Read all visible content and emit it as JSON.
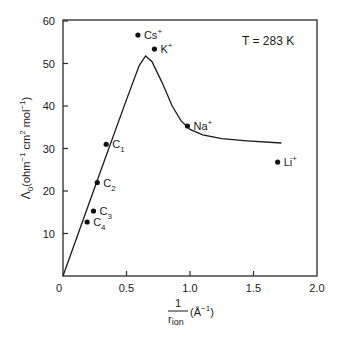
{
  "chart_data": {
    "type": "scatter",
    "title": "",
    "annotation": "T = 283 K",
    "xlabel": "1/r_ion (Å^-1)",
    "xlabel_parts": {
      "numerator": "1",
      "denominator": "r",
      "denominator_sub": "ion",
      "unit": "(Å",
      "unit_sup": "−1",
      "unit_close": ")"
    },
    "ylabel": "Λ0 (ohm^-1 cm^2 mol^-1)",
    "ylabel_parts": {
      "symbol": "Λ",
      "sub": "0",
      "unit": "(ohm",
      "sup1": "−1",
      "mid": " cm",
      "sup2": "2",
      "mid2": " mol",
      "sup3": "−1",
      "close": ")"
    },
    "xlim": [
      0,
      2.0
    ],
    "ylim": [
      0,
      60
    ],
    "xticks": [
      0,
      0.5,
      1.0,
      1.5,
      2.0
    ],
    "xtick_labels": [
      "0",
      "0.5",
      "1.0",
      "1.5",
      "2.0"
    ],
    "yticks": [
      10,
      20,
      30,
      40,
      50,
      60
    ],
    "ytick_labels": [
      "10",
      "20",
      "30",
      "40",
      "50",
      "60"
    ],
    "grid": false,
    "legend": null,
    "points": [
      {
        "label": "Cs",
        "sup": "+",
        "x": 0.59,
        "y": 56.7
      },
      {
        "label": "K",
        "sup": "+",
        "x": 0.72,
        "y": 53.4
      },
      {
        "label": "Na",
        "sup": "+",
        "x": 0.98,
        "y": 35.3
      },
      {
        "label": "Li",
        "sup": "+",
        "x": 1.69,
        "y": 26.8
      },
      {
        "label": "C",
        "sub": "1",
        "x": 0.34,
        "y": 31.0
      },
      {
        "label": "C",
        "sub": "2",
        "x": 0.27,
        "y": 22.0
      },
      {
        "label": "C",
        "sub": "3",
        "x": 0.24,
        "y": 15.3
      },
      {
        "label": "C",
        "sub": "4",
        "x": 0.19,
        "y": 12.7
      }
    ],
    "curve": {
      "name": "theoretical",
      "x": [
        0,
        0.3,
        0.5,
        0.6,
        0.65,
        0.7,
        0.78,
        0.86,
        0.93,
        1.0,
        1.1,
        1.25,
        1.45,
        1.72
      ],
      "y": [
        0,
        25.0,
        41.5,
        49.5,
        51.8,
        50.5,
        45.5,
        40.0,
        36.5,
        34.5,
        33.2,
        32.3,
        31.8,
        31.3
      ]
    }
  }
}
